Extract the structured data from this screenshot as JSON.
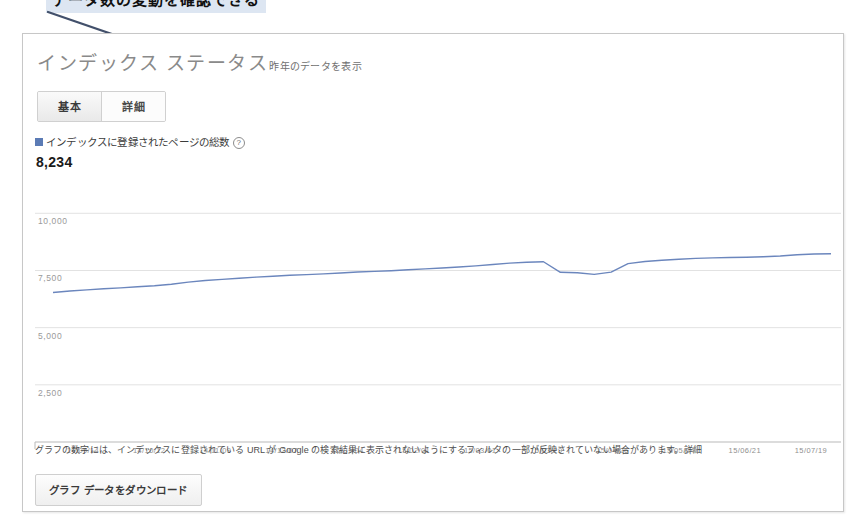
{
  "annotation": {
    "text": "データ数の変動を確認できる",
    "arrow_color": "#42506b"
  },
  "card": {
    "title": "インデックス ステータス",
    "subnote": "昨年のデータを表示"
  },
  "tabs": [
    {
      "label": "基本",
      "active": true
    },
    {
      "label": "詳細",
      "active": false
    }
  ],
  "legend": {
    "label": "インデックスに登録されたページの総数",
    "help_icon": "?",
    "value": "8,234",
    "color": "#5b7bb5"
  },
  "footer": {
    "note": "グラフの数字には、インデックスに登録されている URL が Google の検索結果に表示されないようにするフィルタの一部が反映されていない場合があります。",
    "link_label": "詳細"
  },
  "download_button": {
    "label": "グラフ データをダウンロード"
  },
  "chart_data": {
    "type": "line",
    "title": "インデックス ステータス",
    "xlabel": "",
    "ylabel": "",
    "ylim": [
      0,
      10000
    ],
    "yticks": [
      "2,500",
      "5,000",
      "7,500",
      "10,000"
    ],
    "ytick_values": [
      2500,
      5000,
      7500,
      10000
    ],
    "grid": true,
    "legend_position": "top-left",
    "line_color": "#6b86bd",
    "xticks": [
      "14/09/14",
      "14/10/12",
      "14/11/09",
      "14/12/07",
      "15/01/04",
      "15/02/01",
      "15/03/01",
      "15/03/29",
      "15/04/26",
      "15/05/24",
      "15/06/21",
      "15/07/19"
    ],
    "series": [
      {
        "name": "インデックスに登録されたページの総数",
        "latest_value": 8234,
        "x": [
          "14/09/07",
          "14/09/14",
          "14/09/21",
          "14/09/28",
          "14/10/05",
          "14/10/12",
          "14/10/19",
          "14/10/26",
          "14/11/02",
          "14/11/09",
          "14/11/16",
          "14/11/23",
          "14/11/30",
          "14/12/07",
          "14/12/14",
          "14/12/21",
          "14/12/28",
          "15/01/04",
          "15/01/11",
          "15/01/18",
          "15/01/25",
          "15/02/01",
          "15/02/08",
          "15/02/15",
          "15/02/22",
          "15/03/01",
          "15/03/08",
          "15/03/15",
          "15/03/22",
          "15/03/29",
          "15/04/05",
          "15/04/12",
          "15/04/19",
          "15/04/26",
          "15/05/03",
          "15/05/10",
          "15/05/17",
          "15/05/24",
          "15/05/31",
          "15/06/07",
          "15/06/14",
          "15/06/21",
          "15/06/28",
          "15/07/05",
          "15/07/12",
          "15/07/19",
          "15/07/26"
        ],
        "values": [
          6540,
          6600,
          6650,
          6700,
          6740,
          6790,
          6830,
          6900,
          6990,
          7060,
          7110,
          7160,
          7210,
          7250,
          7290,
          7320,
          7350,
          7390,
          7430,
          7460,
          7490,
          7530,
          7570,
          7610,
          7650,
          7700,
          7760,
          7820,
          7860,
          7880,
          7420,
          7400,
          7330,
          7430,
          7800,
          7890,
          7950,
          7990,
          8030,
          8050,
          8070,
          8080,
          8100,
          8130,
          8190,
          8220,
          8234
        ]
      }
    ]
  }
}
